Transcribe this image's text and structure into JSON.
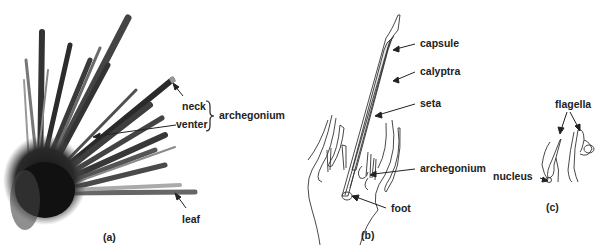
{
  "figure": {
    "panels": [
      {
        "id": "a",
        "caption": "(a)",
        "type": "micrograph",
        "labels": {
          "neck": "neck",
          "venter": "venter",
          "group": "archegonium",
          "leaf": "leaf"
        }
      },
      {
        "id": "b",
        "caption": "(b)",
        "type": "line-drawing",
        "labels": {
          "capsule": "capsule",
          "calyptra": "calyptra",
          "seta": "seta",
          "archegonium": "archegonium",
          "foot": "foot"
        }
      },
      {
        "id": "c",
        "caption": "(c)",
        "type": "line-drawing",
        "labels": {
          "flagella": "flagella",
          "nucleus": "nucleus"
        }
      }
    ],
    "colors": {
      "ink": "#222222",
      "tissue_dark": "#1a1a1a",
      "tissue_mid": "#5a5a5a",
      "background": "#ffffff"
    }
  }
}
